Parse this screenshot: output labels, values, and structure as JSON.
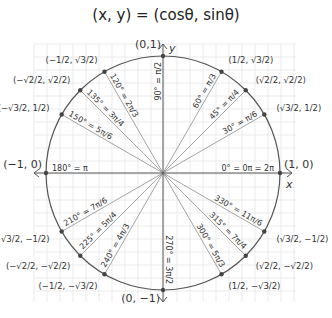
{
  "title": "(x, y) = (cosθ, sinθ)",
  "colors": {
    "grid": "#e6e6e6",
    "circle": "#555555",
    "axis": "#555555",
    "radius": "#9a9a9a",
    "text": "#333333",
    "point": "#444444"
  },
  "geometry": {
    "cx": 163,
    "cy": 173,
    "r": 117,
    "grid_x0": 34,
    "grid_y0": 44,
    "grid_x1": 296,
    "grid_y1": 302,
    "grid_step": 13
  },
  "axes": {
    "x_label": "x",
    "y_label": "y"
  },
  "angles": [
    {
      "deg": 0,
      "label": "0° = 0π = 2π",
      "coord": "(1, 0)"
    },
    {
      "deg": 30,
      "label": "30° = π/6",
      "coord": "(√3/2, 1/2)"
    },
    {
      "deg": 45,
      "label": "45° = π/4",
      "coord": "(√2/2, √2/2)"
    },
    {
      "deg": 60,
      "label": "60° = π/3",
      "coord": "(1/2, √3/2)"
    },
    {
      "deg": 90,
      "label": "90° = π/2",
      "coord": "(0,1)"
    },
    {
      "deg": 120,
      "label": "120° = 2π/3",
      "coord": "(−1/2, √3/2)"
    },
    {
      "deg": 135,
      "label": "135° = 3π/4",
      "coord": "(−√2/2, √2/2)"
    },
    {
      "deg": 150,
      "label": "150° = 5π/6",
      "coord": "(−√3/2, 1/2)"
    },
    {
      "deg": 180,
      "label": "180° = π",
      "coord": "(−1, 0)"
    },
    {
      "deg": 210,
      "label": "210° = 7π/6",
      "coord": "(−√3/2, −1/2)"
    },
    {
      "deg": 225,
      "label": "225° = 5π/4",
      "coord": "(−√2/2, −√2/2)"
    },
    {
      "deg": 240,
      "label": "240° = 4π/3",
      "coord": "(−1/2, −√3/2)"
    },
    {
      "deg": 270,
      "label": "270° = 3π/2",
      "coord": "(0, −1)"
    },
    {
      "deg": 300,
      "label": "300° = 5π/3",
      "coord": "(1/2, −√3/2)"
    },
    {
      "deg": 315,
      "label": "315° = 7π/4",
      "coord": "(√2/2, −√2/2)"
    },
    {
      "deg": 330,
      "label": "330° = 11π/6",
      "coord": "(√3/2, −1/2)"
    }
  ]
}
